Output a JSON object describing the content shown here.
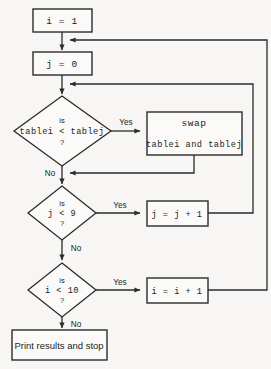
{
  "diagram": {
    "type": "flowchart",
    "nodes": [
      {
        "id": "init-i",
        "shape": "process",
        "text": "i = 1"
      },
      {
        "id": "init-j",
        "shape": "process",
        "text": "j = 0"
      },
      {
        "id": "compare",
        "shape": "decision",
        "line1": "is",
        "line2": "tablei < tablej",
        "line3": "?"
      },
      {
        "id": "swap",
        "shape": "process",
        "line1": "swap",
        "line2": "tablei and tablej"
      },
      {
        "id": "check-j",
        "shape": "decision",
        "line1": "is",
        "line2": "j < 9",
        "line3": "?"
      },
      {
        "id": "incr-j",
        "shape": "process",
        "text": "j = j + 1"
      },
      {
        "id": "check-i",
        "shape": "decision",
        "line1": "is",
        "line2": "i < 10",
        "line3": "?"
      },
      {
        "id": "incr-i",
        "shape": "process",
        "text": "i = i + 1"
      },
      {
        "id": "print",
        "shape": "terminal",
        "text": "Print results and stop"
      }
    ],
    "edge_labels": {
      "compare_yes": "Yes",
      "compare_no": "No",
      "check_j_yes": "Yes",
      "check_j_no": "No",
      "check_i_yes": "Yes",
      "check_i_no": "No"
    },
    "colors": {
      "stroke": "#2b2b2b",
      "node_fill": "#fbfaf8",
      "background": "#f7f6f4",
      "text": "#1c1c1c"
    }
  }
}
